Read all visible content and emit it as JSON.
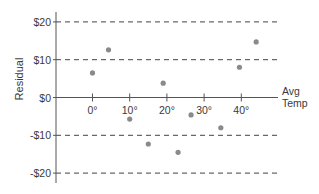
{
  "chart_data": {
    "type": "scatter",
    "title": "",
    "xlabel": "Avg Temp",
    "ylabel": "Residual",
    "xlim": [
      -10,
      49
    ],
    "ylim": [
      -22,
      22
    ],
    "grid": "dashed horizontal lines at $20, $10, -$10, -$20",
    "x_ticks": [
      0,
      10,
      20,
      30,
      40
    ],
    "x_tick_labels": [
      "0°",
      "10°",
      "20°",
      "30°",
      "40°"
    ],
    "y_ticks": [
      20,
      10,
      0,
      -10,
      -20
    ],
    "y_tick_labels": [
      "$20",
      "$10",
      "$0",
      "-$10",
      "-$20"
    ],
    "series": [
      {
        "name": "Residuals",
        "color": "#8a8a8a",
        "points": [
          {
            "x": 0,
            "y": 6.5
          },
          {
            "x": 4.3,
            "y": 12.6
          },
          {
            "x": 10,
            "y": -5.7
          },
          {
            "x": 15,
            "y": -12.3
          },
          {
            "x": 19,
            "y": 3.8
          },
          {
            "x": 23,
            "y": -14.5
          },
          {
            "x": 26.5,
            "y": -4.6
          },
          {
            "x": 34.5,
            "y": -8
          },
          {
            "x": 39.5,
            "y": 8
          },
          {
            "x": 44,
            "y": 14.7
          }
        ]
      }
    ]
  },
  "colors": {
    "axis": "#555555",
    "grid": "#444444",
    "point": "#8a8a8a",
    "text": "#3a3a3a"
  }
}
